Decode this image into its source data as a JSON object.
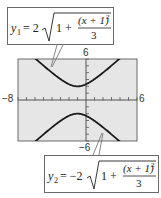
{
  "chart_data": {
    "type": "line",
    "title": "",
    "xlabel": "",
    "ylabel": "",
    "xlim": [
      -8,
      6
    ],
    "ylim": [
      -6,
      6
    ],
    "grid": false,
    "x_tick_step": 1,
    "y_tick_step": 1,
    "axis_labels": {
      "xmin": "−8",
      "xmax": "6",
      "ymax": "6",
      "ymin": "−6"
    },
    "series": [
      {
        "name": "y1",
        "equation": "y1 = 2√(1 + (x + 1)² / 3)",
        "formula_parts": {
          "lhs": "y",
          "sub": "1",
          "coef": "= 2",
          "one": "1 +",
          "num": "(x + 1)",
          "exp": "2",
          "den": "3"
        },
        "x": [
          -8,
          -7,
          -6,
          -5,
          -4,
          -3,
          -2,
          -1,
          0,
          1,
          2,
          3,
          4,
          5,
          6
        ],
        "values": [
          8.33,
          7.21,
          6.11,
          5.03,
          4.0,
          3.06,
          2.31,
          2.0,
          2.31,
          3.06,
          4.0,
          5.03,
          6.11,
          7.21,
          8.33
        ]
      },
      {
        "name": "y2",
        "equation": "y2 = −2√(1 + (x + 1)² / 3)",
        "formula_parts": {
          "lhs": "y",
          "sub": "2",
          "coef": "= −2",
          "one": "1 +",
          "num": "(x + 1)",
          "exp": "2",
          "den": "3"
        },
        "x": [
          -8,
          -7,
          -6,
          -5,
          -4,
          -3,
          -2,
          -1,
          0,
          1,
          2,
          3,
          4,
          5,
          6
        ],
        "values": [
          -8.33,
          -7.21,
          -6.11,
          -5.03,
          -4.0,
          -3.06,
          -2.31,
          -2.0,
          -2.31,
          -3.06,
          -4.0,
          -5.03,
          -6.11,
          -7.21,
          -8.33
        ]
      }
    ]
  },
  "colors": {
    "plot_background": "#e6e6e6",
    "curve": "#1a1a1a",
    "axis": "#555555",
    "frame": "#6a6a6a"
  }
}
